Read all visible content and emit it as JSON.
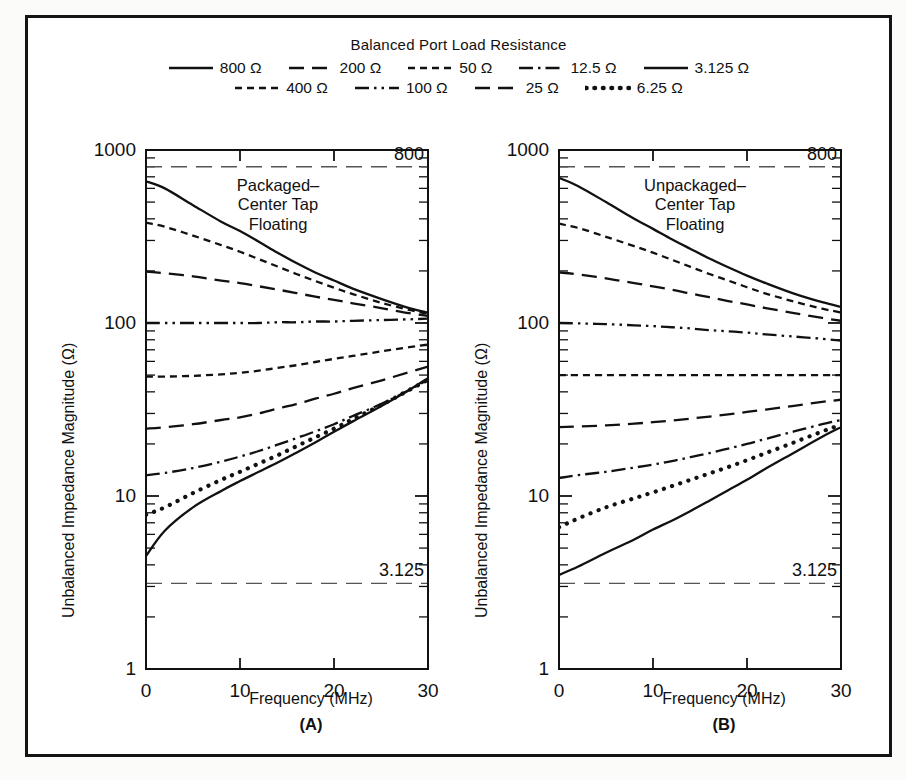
{
  "figure": {
    "legend": {
      "title": "Balanced Port Load Resistance",
      "rows": [
        [
          {
            "label": "800 Ω",
            "style": "solid"
          },
          {
            "label": "200 Ω",
            "style": "dash-long"
          },
          {
            "label": "50 Ω",
            "style": "dash-short"
          },
          {
            "label": "12.5 Ω",
            "style": "dash-dot"
          },
          {
            "label": "3.125 Ω",
            "style": "solid"
          }
        ],
        [
          {
            "label": "400 Ω",
            "style": "dash-short"
          },
          {
            "label": "100 Ω",
            "style": "dash-dot-dot"
          },
          {
            "label": "25 Ω",
            "style": "dash-long"
          },
          {
            "label": "6.25 Ω",
            "style": "dotted"
          }
        ]
      ]
    },
    "panels": [
      {
        "letter": "(A)",
        "annotation": "Packaged–\nCenter Tap\nFloating",
        "xlabel": "Frequency (MHz)",
        "ylabel": "Unbalanced Impedance Magnitude (Ω)"
      },
      {
        "letter": "(B)",
        "annotation": "Unpackaged–\nCenter Tap\nFloating",
        "xlabel": "Frequency (MHz)",
        "ylabel": "Unbalanced Impedance Magnitude (Ω)"
      }
    ]
  },
  "chart_data": [
    {
      "type": "line",
      "title": "Packaged–Center Tap Floating",
      "panel": "(A)",
      "xlabel": "Frequency (MHz)",
      "ylabel": "Unbalanced Impedance Magnitude (Ω)",
      "xlim": [
        0,
        30
      ],
      "ylim": [
        1,
        1000
      ],
      "yscale": "log",
      "xticks": [
        0,
        10,
        20,
        30
      ],
      "yticks": [
        1,
        10,
        100,
        1000
      ],
      "grid": false,
      "legend_position": "above-figure",
      "reference_lines": [
        {
          "label": "800",
          "value": 800,
          "style": "dash-long"
        },
        {
          "label": "3.125",
          "value": 3.125,
          "style": "dash-long"
        }
      ],
      "x": [
        0,
        2,
        5,
        8,
        10,
        12,
        14,
        16,
        18,
        20,
        22,
        25,
        28,
        30
      ],
      "series": [
        {
          "name": "800 Ω",
          "style": "solid",
          "values": [
            660,
            600,
            480,
            385,
            340,
            295,
            255,
            222,
            196,
            176,
            158,
            138,
            122,
            115
          ]
        },
        {
          "name": "400 Ω",
          "style": "dash-short",
          "values": [
            380,
            360,
            320,
            282,
            258,
            234,
            212,
            192,
            175,
            160,
            147,
            131,
            119,
            113
          ]
        },
        {
          "name": "200 Ω",
          "style": "dash-long",
          "values": [
            198,
            194,
            186,
            176,
            170,
            163,
            156,
            149,
            142,
            136,
            130,
            122,
            114,
            110
          ]
        },
        {
          "name": "100 Ω",
          "style": "dash-dot-dot",
          "values": [
            100,
            100,
            100,
            100,
            100,
            100,
            101,
            101,
            102,
            102,
            103,
            104,
            105,
            106
          ]
        },
        {
          "name": "50 Ω",
          "style": "dash-short",
          "values": [
            49,
            49,
            49.5,
            50.5,
            51.5,
            53,
            55,
            57,
            59.5,
            62,
            64.5,
            68.5,
            72.5,
            75
          ]
        },
        {
          "name": "25 Ω",
          "style": "dash-long",
          "values": [
            24.5,
            25,
            26,
            27.5,
            28.5,
            30,
            32,
            34,
            36.5,
            39,
            42,
            46.5,
            52,
            56
          ]
        },
        {
          "name": "12.5 Ω",
          "style": "dash-dot",
          "values": [
            13.2,
            13.6,
            14.5,
            15.8,
            16.9,
            18.2,
            19.8,
            21.6,
            23.6,
            26,
            29,
            34,
            41,
            47
          ]
        },
        {
          "name": "6.25 Ω",
          "style": "dotted",
          "values": [
            7.8,
            8.6,
            10.4,
            12.4,
            13.8,
            15.4,
            17.2,
            19.4,
            21.8,
            24.5,
            27.8,
            33.5,
            41,
            47
          ]
        },
        {
          "name": "3.125 Ω",
          "style": "solid",
          "values": [
            4.5,
            6.3,
            8.6,
            10.7,
            12.2,
            13.8,
            15.6,
            17.8,
            20.4,
            23.5,
            27,
            33,
            41,
            48
          ]
        }
      ]
    },
    {
      "type": "line",
      "title": "Unpackaged–Center Tap Floating",
      "panel": "(B)",
      "xlabel": "Frequency (MHz)",
      "ylabel": "Unbalanced Impedance Magnitude (Ω)",
      "xlim": [
        0,
        30
      ],
      "ylim": [
        1,
        1000
      ],
      "yscale": "log",
      "xticks": [
        0,
        10,
        20,
        30
      ],
      "yticks": [
        1,
        10,
        100,
        1000
      ],
      "grid": false,
      "legend_position": "above-figure",
      "reference_lines": [
        {
          "label": "800",
          "value": 800,
          "style": "dash-long"
        },
        {
          "label": "3.125",
          "value": 3.125,
          "style": "dash-long"
        }
      ],
      "x": [
        0,
        2,
        5,
        8,
        10,
        12,
        14,
        16,
        18,
        20,
        22,
        25,
        28,
        30
      ],
      "series": [
        {
          "name": "800 Ω",
          "style": "solid",
          "values": [
            690,
            620,
            500,
            400,
            350,
            305,
            268,
            236,
            210,
            188,
            170,
            148,
            132,
            124
          ]
        },
        {
          "name": "400 Ω",
          "style": "dash-short",
          "values": [
            375,
            355,
            315,
            278,
            255,
            232,
            211,
            192,
            176,
            161,
            148,
            133,
            121,
            115
          ]
        },
        {
          "name": "200 Ω",
          "style": "dash-long",
          "values": [
            196,
            191,
            181,
            170,
            163,
            156,
            148,
            141,
            134,
            128,
            122,
            114,
            107,
            103
          ]
        },
        {
          "name": "100 Ω",
          "style": "dash-dot-dot",
          "values": [
            100,
            99.5,
            98.5,
            97,
            96,
            94.5,
            93,
            91,
            89.5,
            88,
            86,
            83.5,
            81,
            79
          ]
        },
        {
          "name": "50 Ω",
          "style": "dash-short",
          "values": [
            50,
            50,
            50,
            50,
            50,
            50,
            50,
            50,
            50,
            50,
            50,
            50,
            50,
            50
          ]
        },
        {
          "name": "25 Ω",
          "style": "dash-long",
          "values": [
            25,
            25.2,
            25.6,
            26.2,
            26.7,
            27.3,
            28,
            28.8,
            29.6,
            30.6,
            31.6,
            33.2,
            35,
            36
          ]
        },
        {
          "name": "12.5 Ω",
          "style": "dash-dot",
          "values": [
            12.7,
            13.2,
            13.8,
            14.6,
            15.2,
            15.9,
            16.8,
            17.7,
            18.8,
            20,
            21.4,
            23.6,
            26,
            27.5
          ]
        },
        {
          "name": "6.25 Ω",
          "style": "dotted",
          "values": [
            6.6,
            7.4,
            8.6,
            9.7,
            10.5,
            11.4,
            12.4,
            13.5,
            14.7,
            16.1,
            17.7,
            20.4,
            23.6,
            25.8
          ]
        },
        {
          "name": "3.125 Ω",
          "style": "solid",
          "values": [
            3.5,
            3.9,
            4.7,
            5.6,
            6.4,
            7.2,
            8.2,
            9.4,
            10.8,
            12.4,
            14.4,
            17.8,
            22,
            25
          ]
        }
      ]
    }
  ]
}
